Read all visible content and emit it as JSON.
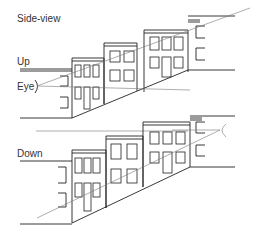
{
  "diagram": {
    "title": "Side-view",
    "panels": [
      {
        "id": "up",
        "label": "Up",
        "eye_label": "Eye"
      },
      {
        "id": "down",
        "label": "Down"
      }
    ],
    "colors": {
      "ink": "#222222",
      "sightline": "#777777",
      "text": "#333333"
    }
  }
}
